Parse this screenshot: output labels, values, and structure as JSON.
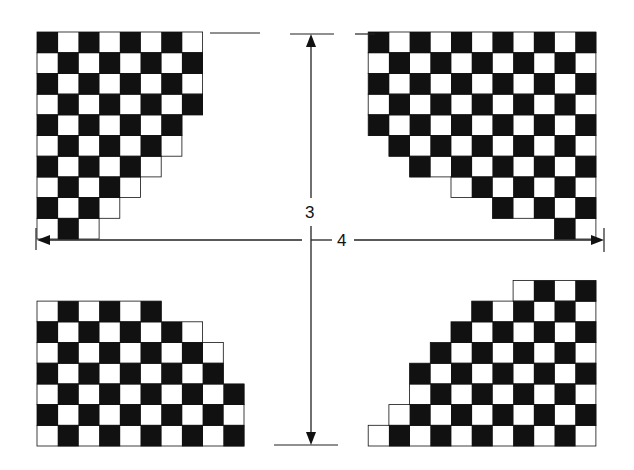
{
  "diagram": {
    "type": "checkerboard-corners-dimension",
    "colors": {
      "dark": "#111111",
      "light": "#ffffff",
      "line": "#222222"
    },
    "board": {
      "x": 37,
      "y": 32,
      "width": 567,
      "height": 413,
      "cell": 21
    },
    "dimensions": {
      "vertical": {
        "label": "3",
        "x": 311,
        "y1": 35,
        "y2": 445
      },
      "horizontal": {
        "label": "4",
        "y": 240,
        "x1": 37,
        "x2": 604
      }
    },
    "quadrants": [
      {
        "name": "top-left",
        "description": "checkerboard corner fading diagonally toward center"
      },
      {
        "name": "top-right",
        "description": "checkerboard corner fading diagonally toward center"
      },
      {
        "name": "bottom-left",
        "description": "checkerboard corner fading diagonally toward center"
      },
      {
        "name": "bottom-right",
        "description": "checkerboard corner fading diagonally toward center"
      }
    ]
  }
}
